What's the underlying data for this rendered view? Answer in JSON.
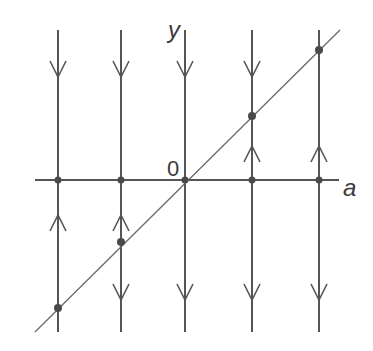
{
  "diagram": {
    "title": "",
    "labels": {
      "y_axis": "y",
      "x_axis": "a",
      "origin": "0"
    },
    "colors": {
      "line": "#555555",
      "diagonal": "#6a6a6a",
      "dot": "#4a4a4a",
      "text": "#3a3a3a"
    },
    "vertical_lines": [
      {
        "x": 58,
        "upper_arrow": "down",
        "lower_arrow": "up",
        "diagonal_dot_y": 308
      },
      {
        "x": 121,
        "upper_arrow": "down",
        "lower_arrow": "up+down",
        "diagonal_dot_y": 242
      },
      {
        "x": 185,
        "upper_arrow": "down",
        "lower_arrow": "down",
        "diagonal_dot_y": 180
      },
      {
        "x": 252,
        "upper_arrow": "down+up",
        "lower_arrow": "down",
        "diagonal_dot_y": 116
      },
      {
        "x": 319,
        "upper_arrow": "up",
        "lower_arrow": "down",
        "diagonal_dot_y": 50
      }
    ],
    "horizontal_axis_y": 180,
    "diagonal": {
      "from": [
        35,
        332
      ],
      "to": [
        340,
        30
      ],
      "description": "line y = a"
    }
  }
}
